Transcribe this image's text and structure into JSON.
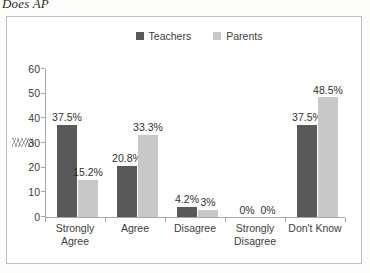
{
  "caption": "Does AP",
  "legend": {
    "position": "top-center",
    "items": [
      {
        "label": "Teachers",
        "color": "#595959"
      },
      {
        "label": "Parents",
        "color": "#c8c8c8"
      }
    ]
  },
  "axis": {
    "y_ticks": [
      "0",
      "10",
      "20",
      "30",
      "40",
      "50",
      "60"
    ],
    "y_min": 0,
    "y_max": 60,
    "y_step": 10,
    "grid": false
  },
  "chart_data": {
    "type": "bar",
    "title": "Does AP",
    "xlabel": "",
    "ylabel": "",
    "ylim": [
      0,
      60
    ],
    "grid": false,
    "legend_position": "top-center",
    "categories": [
      "Strongly Agree",
      "Agree",
      "Disagree",
      "Strongly Disagree",
      "Don't Know"
    ],
    "series": [
      {
        "name": "Teachers",
        "color": "#595959",
        "values": [
          37.5,
          20.8,
          4.2,
          0,
          37.5
        ],
        "labels": [
          "37.5%",
          "20.8%",
          "4.2%",
          "0%",
          "37.5%"
        ]
      },
      {
        "name": "Parents",
        "color": "#c8c8c8",
        "values": [
          15.2,
          33.3,
          3,
          0,
          48.5
        ],
        "labels": [
          "15.2%",
          "33.3%",
          "3%",
          "0%",
          "48.5%"
        ]
      }
    ]
  }
}
